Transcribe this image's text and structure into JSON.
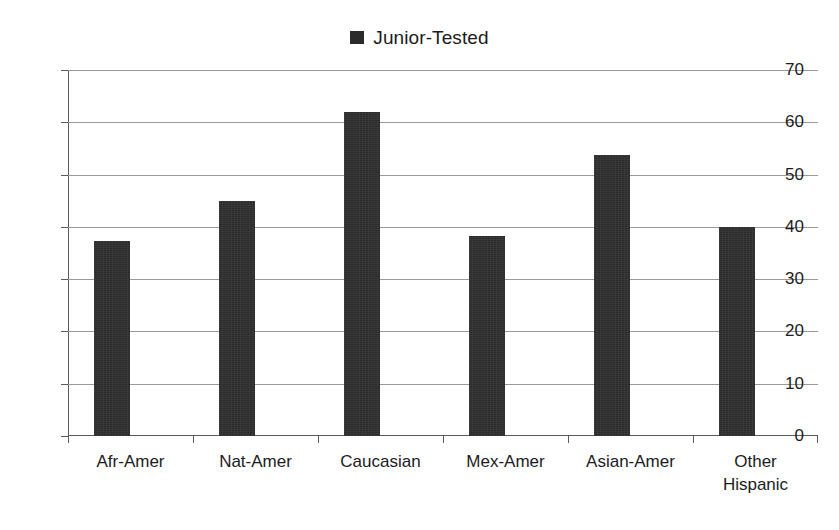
{
  "chart_data": {
    "type": "bar",
    "title": "",
    "subtitle": "",
    "xlabel": "",
    "ylabel": "",
    "categories": [
      "Afr-Amer",
      "Nat-Amer",
      "Caucasian",
      "Mex-Amer",
      "Asian-Amer",
      "Other Hispanic"
    ],
    "category_lines": [
      [
        "Afr-Amer"
      ],
      [
        "Nat-Amer"
      ],
      [
        "Caucasian"
      ],
      [
        "Mex-Amer"
      ],
      [
        "Asian-Amer"
      ],
      [
        "Other",
        "Hispanic"
      ]
    ],
    "series": [
      {
        "name": "Junior-Tested",
        "color": "#2b2b2b",
        "values": [
          37.3,
          45.0,
          62.0,
          38.2,
          53.8,
          40.0
        ]
      }
    ],
    "ylim": [
      0,
      70
    ],
    "ytick_values": [
      0,
      10,
      20,
      30,
      40,
      50,
      60,
      70
    ],
    "ytick_labels": [
      "0",
      "10",
      "20",
      "30",
      "40",
      "50",
      "60",
      "70"
    ],
    "ytick_step": 10,
    "grid": "horizontal",
    "legend": {
      "position": "top-center",
      "entries": [
        {
          "label": "Junior-Tested",
          "marker": "filled-square",
          "color": "#2b2b2b"
        }
      ]
    },
    "colors": {
      "bar": "#2b2b2b",
      "gridline": "#9a9a9a",
      "axis": "#5a5a5a",
      "background": "#ffffff",
      "text": "#1c1c1c"
    }
  }
}
